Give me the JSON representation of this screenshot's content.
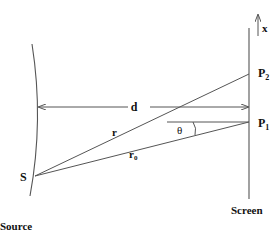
{
  "diagram": {
    "type": "double-slit / path-difference geometry",
    "labels": {
      "x_axis": "x",
      "p2": "P",
      "p2_sub": "2",
      "p1": "P",
      "p1_sub": "1",
      "distance": "d",
      "path_r": "r",
      "path_r0": "r",
      "path_r0_sub": "0",
      "angle": "θ",
      "source_point": "S",
      "source_caption": "Source",
      "screen_caption": "Screen"
    },
    "colors": {
      "line": "#555555",
      "text": "#111111",
      "background": "#ffffff"
    }
  }
}
